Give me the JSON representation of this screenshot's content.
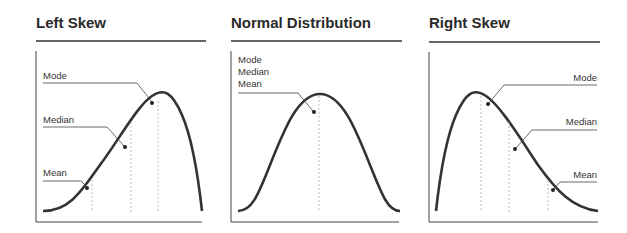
{
  "panels": [
    {
      "title": "Left Skew",
      "labels": {
        "mode": "Mode",
        "median": "Median",
        "mean": "Mean"
      }
    },
    {
      "title": "Normal Distribution",
      "labels": {
        "mode": "Mode",
        "median": "Median",
        "mean": "Mean"
      }
    },
    {
      "title": "Right Skew",
      "labels": {
        "mode": "Mode",
        "median": "Median",
        "mean": "Mean"
      }
    }
  ],
  "colors": {
    "curve": "#333333",
    "axis": "#333333",
    "dashed": "#999999",
    "text": "#333333"
  }
}
